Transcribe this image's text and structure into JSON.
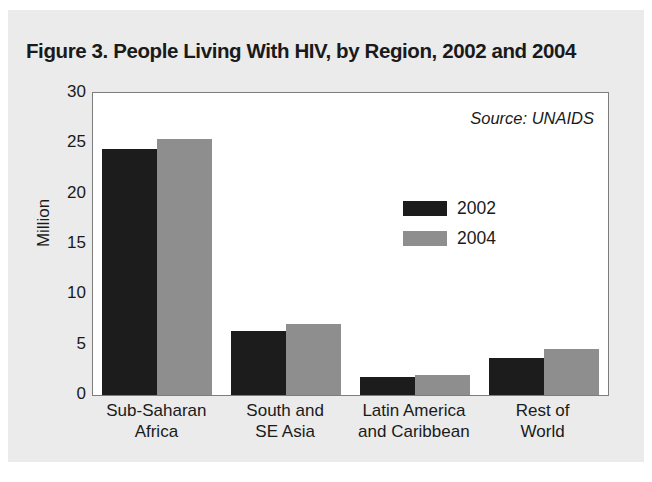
{
  "figure": {
    "title": "Figure 3. People Living With HIV, by Region, 2002 and 2004",
    "source_note": "Source: UNAIDS",
    "card_background": "#ebebeb",
    "plot_background": "#ffffff",
    "frame_color": "#7d7d7d"
  },
  "chart_data": {
    "type": "bar",
    "title": "Figure 3. People Living With HIV, by Region, 2002 and 2004",
    "xlabel": "",
    "ylabel": "Million",
    "ylim": [
      0,
      30
    ],
    "yticks": [
      0,
      5,
      10,
      15,
      20,
      25,
      30
    ],
    "ytick_labels": [
      "0",
      "5",
      "10",
      "15",
      "20",
      "25",
      "30"
    ],
    "grid": false,
    "legend_position": "upper right (inside plot)",
    "annotations": [
      "Source: UNAIDS"
    ],
    "categories": [
      "Sub-Saharan Africa",
      "South and SE Asia",
      "Latin America and Caribbean",
      "Rest of World"
    ],
    "category_lines": [
      [
        "Sub-Saharan",
        "Africa"
      ],
      [
        "South and",
        "SE Asia"
      ],
      [
        "Latin America",
        "and Caribbean"
      ],
      [
        "Rest of",
        "World"
      ]
    ],
    "series": [
      {
        "name": "2002",
        "color": "#1c1c1c",
        "values": [
          24.4,
          6.4,
          1.8,
          3.7
        ]
      },
      {
        "name": "2004",
        "color": "#8e8e8e",
        "values": [
          25.4,
          7.1,
          2.0,
          4.6
        ]
      }
    ]
  }
}
